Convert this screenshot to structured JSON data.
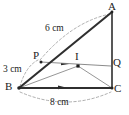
{
  "figure": {
    "type": "geometry-diagram",
    "vertices": [
      {
        "name": "A",
        "label": "A",
        "x": 112,
        "y": 12,
        "label_x": 111,
        "label_y": 2
      },
      {
        "name": "B",
        "label": "B",
        "x": 19,
        "y": 88,
        "label_x": 6,
        "label_y": 82
      },
      {
        "name": "C",
        "label": "C",
        "x": 112,
        "y": 88,
        "label_x": 115,
        "label_y": 84
      }
    ],
    "points": [
      {
        "name": "P",
        "label": "P",
        "x": 41,
        "y": 62,
        "label_x": 33,
        "label_y": 52
      },
      {
        "name": "Q",
        "label": "Q",
        "x": 111,
        "y": 66,
        "label_x": 114,
        "label_y": 58
      },
      {
        "name": "I",
        "label": "I",
        "x": 78,
        "y": 66,
        "label_x": 75,
        "label_y": 52
      }
    ],
    "measurements": [
      {
        "name": "side-BA-length",
        "text": "6 cm",
        "x": 45,
        "y": 25
      },
      {
        "name": "segment-BP-length",
        "text": "3 cm",
        "x": 4,
        "y": 66
      },
      {
        "name": "side-BC-length",
        "text": "8 cm",
        "x": 51,
        "y": 99
      }
    ],
    "segments": [
      {
        "name": "side-BA",
        "from": "B",
        "to": "A",
        "style": "thick"
      },
      {
        "name": "side-AC",
        "from": "A",
        "to": "C",
        "style": "thick"
      },
      {
        "name": "side-BC",
        "from": "B",
        "to": "C",
        "style": "thick"
      },
      {
        "name": "segment-PQ",
        "from": "P",
        "to": "Q",
        "style": "thin"
      },
      {
        "name": "segment-BI",
        "from": "B",
        "to": "I",
        "style": "thin"
      },
      {
        "name": "segment-IC",
        "from": "I",
        "to": "C",
        "style": "thin"
      }
    ],
    "arcs": [
      {
        "name": "arc-measure-BA",
        "style": "dashed"
      },
      {
        "name": "arc-measure-BP",
        "style": "dashed"
      },
      {
        "name": "arc-measure-BC",
        "style": "dashed"
      }
    ],
    "markers": [
      {
        "name": "parallel-arrow-PQ",
        "on": "segment-PQ"
      },
      {
        "name": "parallel-arrow-BC",
        "on": "side-BC"
      }
    ],
    "colors": {
      "stroke_dark": "#2b2b2b",
      "stroke_light": "#8c8c8c",
      "dashed": "#9a9a9a",
      "background": "#ffffff",
      "text": "#1c1c1c"
    }
  }
}
